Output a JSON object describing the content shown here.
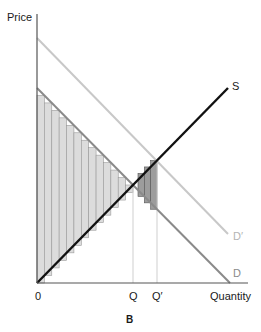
{
  "diagram": {
    "panel_label": "B",
    "y_axis_label": "Price",
    "x_axis_label": "Quantity",
    "origin_label": "0",
    "x_ticks": [
      {
        "label": "Q",
        "x": 133
      },
      {
        "label": "Q′",
        "x": 157
      }
    ],
    "curves": [
      {
        "name": "S",
        "label": "S",
        "color": "#111111",
        "from": [
          37,
          283
        ],
        "to": [
          228,
          88
        ]
      },
      {
        "name": "D",
        "label": "D",
        "color": "#8a8a8a",
        "from": [
          37,
          88
        ],
        "to": [
          230,
          283
        ]
      },
      {
        "name": "D′",
        "label": "D′",
        "color": "#c8c8c8",
        "from": [
          37,
          38
        ],
        "to": [
          228,
          234
        ]
      }
    ],
    "colors": {
      "axis": "#555555",
      "light_bar_fill": "#dcdcdc",
      "light_bar_stroke": "#9a9a9a",
      "dark_bar_fill": "#9c9c9c",
      "dark_bar_stroke": "#555555",
      "guide_line": "#cfcfcf"
    },
    "light_bars": {
      "x_start": 37,
      "x_end": 133,
      "count": 13
    },
    "dark_bars": {
      "x_start": 138,
      "x_end": 157,
      "count": 3
    }
  }
}
